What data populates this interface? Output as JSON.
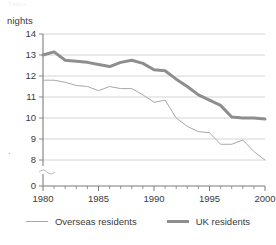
{
  "ghost_title": "Table",
  "axis_unit_label": "nights",
  "stray_mark": "·",
  "legend": {
    "entries": [
      {
        "label": "Overseas residents",
        "style": "thin",
        "color": "#a8a8a8",
        "icon": "line-swatch-icon"
      },
      {
        "label": "UK residents",
        "style": "thick",
        "color": "#8e8e8e",
        "icon": "line-swatch-icon"
      }
    ]
  },
  "chart_data": {
    "type": "line",
    "title": "",
    "subtitle": "",
    "xlabel": "",
    "ylabel": "nights",
    "xlim": [
      1980,
      2000
    ],
    "ylim": [
      7.6,
      14
    ],
    "y_axis_break": true,
    "y_break_between": [
      0,
      8
    ],
    "grid": "horizontal",
    "legend_position": "bottom",
    "y_ticks": [
      0,
      8,
      9,
      10,
      11,
      12,
      13,
      14
    ],
    "y_tick_labels": [
      "0",
      "8",
      "9",
      "10",
      "11",
      "12",
      "13",
      "14"
    ],
    "x_ticks": [
      1980,
      1985,
      1990,
      1995,
      2000
    ],
    "x_tick_labels": [
      "1980",
      "1985",
      "1990",
      "1995",
      "2000"
    ],
    "x_minor_ticks": [
      1981,
      1982,
      1983,
      1984,
      1986,
      1987,
      1988,
      1989,
      1991,
      1992,
      1993,
      1994,
      1996,
      1997,
      1998,
      1999
    ],
    "x": [
      1980,
      1981,
      1982,
      1983,
      1984,
      1985,
      1986,
      1987,
      1988,
      1989,
      1990,
      1991,
      1992,
      1993,
      1994,
      1995,
      1996,
      1997,
      1998,
      1999,
      2000
    ],
    "series": [
      {
        "name": "Overseas residents",
        "color": "#a8a8a8",
        "width": 1,
        "values": [
          11.8,
          11.8,
          11.7,
          11.55,
          11.5,
          11.3,
          11.5,
          11.4,
          11.4,
          11.1,
          10.75,
          10.85,
          10.0,
          9.6,
          9.35,
          9.3,
          8.75,
          8.75,
          8.95,
          8.4,
          8.0
        ]
      },
      {
        "name": "UK residents",
        "color": "#8e8e8e",
        "width": 3,
        "values": [
          13.0,
          13.15,
          12.75,
          12.7,
          12.65,
          12.55,
          12.45,
          12.65,
          12.75,
          12.6,
          12.3,
          12.25,
          11.85,
          11.5,
          11.1,
          10.85,
          10.6,
          10.05,
          10.0,
          10.0,
          9.95
        ]
      }
    ]
  }
}
